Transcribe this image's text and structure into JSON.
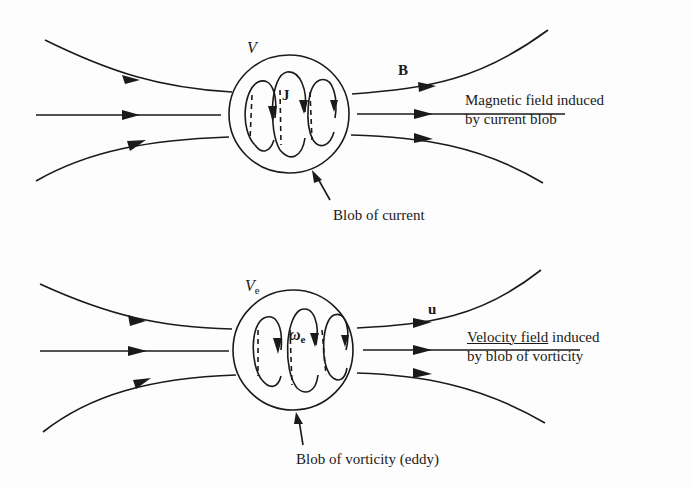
{
  "figure": {
    "top_panel": {
      "volume_label": "V",
      "current_label": "J",
      "field_label": "B",
      "caption_line1": "Magnetic field induced",
      "caption_line2": "by current blob",
      "pointer_label": "Blob of current"
    },
    "bottom_panel": {
      "volume_label": "V",
      "volume_subscript": "e",
      "vorticity_label": "ω",
      "vorticity_subscript": "e",
      "field_label": "u",
      "caption_line1_underlined": "Velocity field",
      "caption_line1_rest": " induced",
      "caption_line2": "by blob of vorticity",
      "pointer_label": "Blob of vorticity (eddy)"
    },
    "colors": {
      "line": "#1a1a1a",
      "background": "#fdfdfd"
    }
  }
}
